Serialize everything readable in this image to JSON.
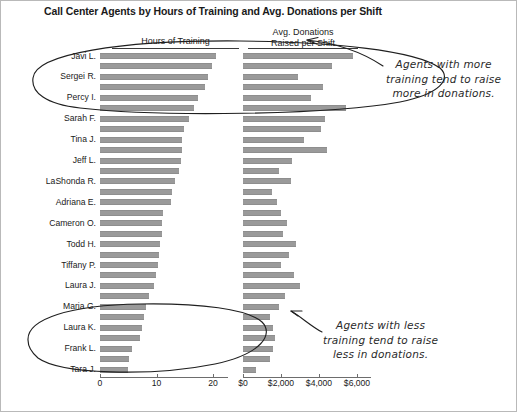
{
  "chart_title": "Call Center Agents by Hours of Training and Avg. Donations per Shift",
  "headers": {
    "left": "Hours of Training",
    "right_line1": "Avg. Donations",
    "right_line2": "Raised per Shift"
  },
  "annotations": {
    "top": [
      "Agents with more",
      "training tend to raise",
      "more in donations."
    ],
    "bottom": [
      "Agents with less",
      "training tend to raise",
      "less in donations."
    ]
  },
  "colors": {
    "bar": "#9a9a9a",
    "axis": "#6d6d6d",
    "text": "#1a1a1a",
    "annotation": "#2a2a2a",
    "frame": "#b9b9b9"
  },
  "chart_data": {
    "type": "bar",
    "title": "Call Center Agents by Hours of Training and Avg. Donations per Shift",
    "layout": "paired horizontal bar panels, sorted descending by hours of training",
    "grid": false,
    "legend": null,
    "categories": [
      "Javi L.",
      "",
      "Sergei R.",
      "",
      "Percy I.",
      "",
      "Sarah F.",
      "",
      "Tina J.",
      "",
      "Jeff L.",
      "",
      "LaShonda R.",
      "",
      "Adriana E.",
      "",
      "Cameron O.",
      "",
      "Todd H.",
      "",
      "Tiffany P.",
      "",
      "Laura J.",
      "",
      "Maria G.",
      "",
      "Laura K.",
      "",
      "Frank L.",
      "",
      "Tara J."
    ],
    "visible_category_labels": [
      "Javi L.",
      "Sergei R.",
      "Percy I.",
      "Sarah F.",
      "Tina J.",
      "Jeff L.",
      "LaShonda R.",
      "Adriana E.",
      "Cameron O.",
      "Todd H.",
      "Tiffany P.",
      "Laura J.",
      "Maria G.",
      "Laura K.",
      "Frank L.",
      "Tara J."
    ],
    "series": [
      {
        "name": "Hours of Training",
        "panel": "left",
        "xlabel": "",
        "xlim": [
          0,
          23
        ],
        "ticks": [
          0,
          10,
          20
        ],
        "tick_labels": [
          "0",
          "10",
          "20"
        ],
        "values": [
          20.5,
          19.8,
          19.1,
          18.6,
          17.4,
          16.6,
          15.7,
          14.9,
          14.6,
          14.5,
          14.3,
          14.0,
          13.2,
          12.8,
          12.6,
          11.2,
          11.0,
          10.9,
          10.7,
          10.4,
          10.2,
          9.9,
          9.6,
          8.7,
          8.2,
          7.8,
          7.4,
          7.0,
          5.6,
          5.1,
          4.9
        ]
      },
      {
        "name": "Avg. Donations Raised per Shift",
        "panel": "right",
        "xlabel": "",
        "xlim": [
          0,
          6800
        ],
        "ticks": [
          0,
          2000,
          4000,
          6000
        ],
        "tick_labels": [
          "$0",
          "$2,000",
          "$4,000",
          "$6,000"
        ],
        "values": [
          5800,
          4700,
          2900,
          4200,
          3600,
          5400,
          4300,
          4100,
          3200,
          4400,
          2600,
          1900,
          2500,
          1500,
          1800,
          2000,
          2300,
          2100,
          2800,
          2400,
          2000,
          2700,
          3000,
          2200,
          1900,
          1400,
          1600,
          1700,
          1600,
          1400,
          700
        ]
      }
    ]
  },
  "axis_ticks": {
    "hours": [
      "0",
      "10",
      "20"
    ],
    "donations": [
      "$0",
      "$2,000",
      "$4,000",
      "$6,000"
    ]
  }
}
